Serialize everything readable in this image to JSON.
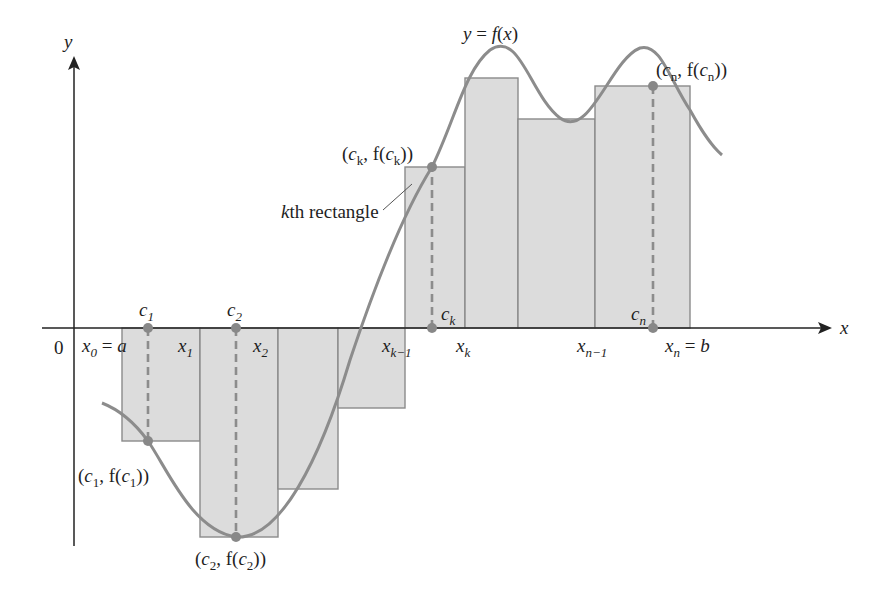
{
  "figure": {
    "colors": {
      "rectangle_fill": "#dcdcdc",
      "rectangle_stroke": "#8a8a8a",
      "curve": "#8c8c8c",
      "axis": "#222222",
      "points": "#888888"
    }
  },
  "axes": {
    "x_label": "x",
    "y_label": "y",
    "origin_label": "0"
  },
  "curve": {
    "label": "y = f(x)"
  },
  "partition": {
    "x0": {
      "base": "x",
      "sub": "0",
      "suffix": " = ",
      "value": "a"
    },
    "x1": {
      "base": "x",
      "sub": "1"
    },
    "x2": {
      "base": "x",
      "sub": "2"
    },
    "xk_minus_1": {
      "base": "x",
      "sub": "k−1"
    },
    "xk": {
      "base": "x",
      "sub": "k"
    },
    "xn_minus_1": {
      "base": "x",
      "sub": "n−1"
    },
    "xn": {
      "base": "x",
      "sub": "n",
      "suffix": " = ",
      "value": "b"
    }
  },
  "sample_points": {
    "c1": {
      "base": "c",
      "sub": "1"
    },
    "c2": {
      "base": "c",
      "sub": "2"
    },
    "ck": {
      "base": "c",
      "sub": "k"
    },
    "cn": {
      "base": "c",
      "sub": "n"
    }
  },
  "point_labels": {
    "c1": {
      "open": "(",
      "c": "c",
      "sub": "1",
      "mid": ", f(",
      "close": "))"
    },
    "c2": {
      "open": "(",
      "c": "c",
      "sub": "2",
      "mid": ", f(",
      "close": "))"
    },
    "ck": {
      "open": "(",
      "c": "c",
      "sub": "k",
      "mid": ", f(",
      "close": "))"
    },
    "cn": {
      "open": "(",
      "c": "c",
      "sub": "n",
      "mid": ", f(",
      "close": "))"
    }
  },
  "annotations": {
    "kth_rectangle": {
      "k": "k",
      "rest": "th rectangle"
    }
  },
  "rectangles": [
    {
      "x_left": 122,
      "x_right": 200,
      "height_sign": "negative"
    },
    {
      "x_left": 200,
      "x_right": 278,
      "height_sign": "negative"
    },
    {
      "x_left": 278,
      "x_right": 338,
      "height_sign": "negative"
    },
    {
      "x_left": 338,
      "x_right": 405,
      "height_sign": "negative"
    },
    {
      "x_left": 405,
      "x_right": 465,
      "height_sign": "positive",
      "is_kth": true
    },
    {
      "x_left": 465,
      "x_right": 518,
      "height_sign": "positive"
    },
    {
      "x_left": 518,
      "x_right": 595,
      "height_sign": "positive"
    },
    {
      "x_left": 595,
      "x_right": 690,
      "height_sign": "positive"
    }
  ]
}
